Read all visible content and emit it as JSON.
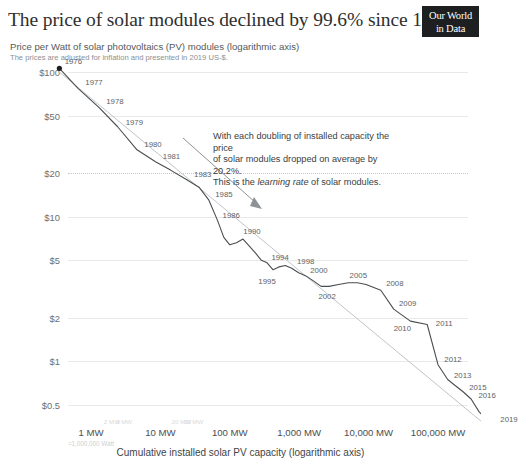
{
  "header": {
    "title": "The price of solar modules declined by 99.6% since 1976",
    "subtitle": "Price per Watt of solar photovoltaics (PV) modules (logarithmic axis)",
    "note": "The prices are adjusted for inflation and presented in 2019 US-$.",
    "badge_line1": "Our World",
    "badge_line2": "in Data"
  },
  "annotation": {
    "line1": "With each doubling of installed capacity the price",
    "line2": "of solar modules dropped on average by 20.2%.",
    "line3_pre": "This is the ",
    "line3_em": "learning rate",
    "line3_post": " of solar modules."
  },
  "axes": {
    "x_title": "Cumulative installed solar PV capacity (logarithmic axis)",
    "mw_note": "=1,000,000 Watt",
    "y_ticks": [
      "$100",
      "$50",
      "$20",
      "$10",
      "$5",
      "$2",
      "$1",
      "$0.5"
    ],
    "y_tick_values": [
      100,
      50,
      20,
      10,
      5,
      2,
      1,
      0.5
    ],
    "x_ticks": [
      "1 MW",
      "10 MW",
      "100 MW",
      "1,000 MW",
      "10,000 MW",
      "100,000 MW"
    ],
    "x_tick_values": [
      1,
      10,
      100,
      1000,
      10000,
      100000
    ],
    "x_minor_ticks": [
      "2 MW",
      "3 MW",
      "20 MW",
      "30 MW"
    ]
  },
  "colors": {
    "line": "#4a4e51",
    "trend": "#c0c4c8",
    "grid": "#e9e9e9",
    "badge_bg": "#1d1f20",
    "text": "#2b2b2b"
  },
  "chart_data": {
    "type": "line",
    "title": "The price of solar modules declined by 99.6% since 1976",
    "subtitle": "Price per Watt of solar photovoltaics (PV) modules (logarithmic axis)",
    "xlabel": "Cumulative installed solar PV capacity (logarithmic axis)",
    "ylabel": "Price per Watt (2019 US-$)",
    "xscale": "log",
    "yscale": "log",
    "xlim": [
      0.3,
      300000
    ],
    "ylim": [
      0.3,
      130
    ],
    "grid": true,
    "legend": "none",
    "learning_rate_percent": 20.2,
    "series": [
      {
        "name": "Solar module price vs cumulative capacity",
        "points": [
          {
            "year": 1976,
            "capacity_mw": 0.35,
            "price_usd_per_watt": 106
          },
          {
            "year": 1977,
            "capacity_mw": 0.65,
            "price_usd_per_watt": 77
          },
          {
            "year": 1978,
            "capacity_mw": 1.3,
            "price_usd_per_watt": 57
          },
          {
            "year": 1979,
            "capacity_mw": 2.4,
            "price_usd_per_watt": 42
          },
          {
            "year": 1980,
            "capacity_mw": 4.6,
            "price_usd_per_watt": 29
          },
          {
            "year": 1981,
            "capacity_mw": 8.5,
            "price_usd_per_watt": 24
          },
          {
            "year": 1982,
            "capacity_mw": 14,
            "price_usd_per_watt": 21
          },
          {
            "year": 1983,
            "capacity_mw": 24,
            "price_usd_per_watt": 18
          },
          {
            "year": 1984,
            "capacity_mw": 36,
            "price_usd_per_watt": 16
          },
          {
            "year": 1985,
            "capacity_mw": 50,
            "price_usd_per_watt": 13
          },
          {
            "year": 1986,
            "capacity_mw": 66,
            "price_usd_per_watt": 9.5
          },
          {
            "year": 1987,
            "capacity_mw": 82,
            "price_usd_per_watt": 7.2
          },
          {
            "year": 1988,
            "capacity_mw": 100,
            "price_usd_per_watt": 6.4
          },
          {
            "year": 1989,
            "capacity_mw": 125,
            "price_usd_per_watt": 6.6
          },
          {
            "year": 1990,
            "capacity_mw": 155,
            "price_usd_per_watt": 7.0
          },
          {
            "year": 1991,
            "capacity_mw": 190,
            "price_usd_per_watt": 6.3
          },
          {
            "year": 1992,
            "capacity_mw": 235,
            "price_usd_per_watt": 5.6
          },
          {
            "year": 1993,
            "capacity_mw": 285,
            "price_usd_per_watt": 5.0
          },
          {
            "year": 1994,
            "capacity_mw": 345,
            "price_usd_per_watt": 4.8
          },
          {
            "year": 1995,
            "capacity_mw": 420,
            "price_usd_per_watt": 4.3
          },
          {
            "year": 1996,
            "capacity_mw": 510,
            "price_usd_per_watt": 4.5
          },
          {
            "year": 1997,
            "capacity_mw": 630,
            "price_usd_per_watt": 4.6
          },
          {
            "year": 1998,
            "capacity_mw": 780,
            "price_usd_per_watt": 4.4
          },
          {
            "year": 1999,
            "capacity_mw": 980,
            "price_usd_per_watt": 4.1
          },
          {
            "year": 2000,
            "capacity_mw": 1250,
            "price_usd_per_watt": 3.9
          },
          {
            "year": 2001,
            "capacity_mw": 1600,
            "price_usd_per_watt": 3.6
          },
          {
            "year": 2002,
            "capacity_mw": 2070,
            "price_usd_per_watt": 3.3
          },
          {
            "year": 2003,
            "capacity_mw": 2700,
            "price_usd_per_watt": 3.3
          },
          {
            "year": 2004,
            "capacity_mw": 3700,
            "price_usd_per_watt": 3.4
          },
          {
            "year": 2005,
            "capacity_mw": 5100,
            "price_usd_per_watt": 3.5
          },
          {
            "year": 2006,
            "capacity_mw": 6900,
            "price_usd_per_watt": 3.5
          },
          {
            "year": 2007,
            "capacity_mw": 9200,
            "price_usd_per_watt": 3.4
          },
          {
            "year": 2008,
            "capacity_mw": 15000,
            "price_usd_per_watt": 3.1
          },
          {
            "year": 2009,
            "capacity_mw": 23000,
            "price_usd_per_watt": 2.3
          },
          {
            "year": 2010,
            "capacity_mw": 40000,
            "price_usd_per_watt": 1.9
          },
          {
            "year": 2011,
            "capacity_mw": 70000,
            "price_usd_per_watt": 1.8
          },
          {
            "year": 2012,
            "capacity_mw": 100000,
            "price_usd_per_watt": 0.95
          },
          {
            "year": 2013,
            "capacity_mw": 138000,
            "price_usd_per_watt": 0.75
          },
          {
            "year": 2014,
            "capacity_mw": 178000,
            "price_usd_per_watt": 0.68
          },
          {
            "year": 2015,
            "capacity_mw": 228000,
            "price_usd_per_watt": 0.62
          },
          {
            "year": 2016,
            "capacity_mw": 300000,
            "price_usd_per_watt": 0.55
          },
          {
            "year": 2017,
            "capacity_mw": 390000,
            "price_usd_per_watt": 0.45
          },
          {
            "year": 2018,
            "capacity_mw": 490000,
            "price_usd_per_watt": 0.4
          },
          {
            "year": 2019,
            "capacity_mw": 620000,
            "price_usd_per_watt": 0.38
          }
        ]
      }
    ],
    "trendline": {
      "name": "learning curve (20.2% learning rate)",
      "from": {
        "capacity_mw": 0.35,
        "price_usd_per_watt": 100
      },
      "to": {
        "capacity_mw": 620000,
        "price_usd_per_watt": 0.33
      }
    },
    "labeled_years": [
      1976,
      1977,
      1978,
      1979,
      1980,
      1981,
      1983,
      1985,
      1986,
      1990,
      1994,
      1995,
      1998,
      2000,
      2002,
      2005,
      2008,
      2009,
      2010,
      2011,
      2012,
      2013,
      2015,
      2016,
      2019
    ]
  }
}
